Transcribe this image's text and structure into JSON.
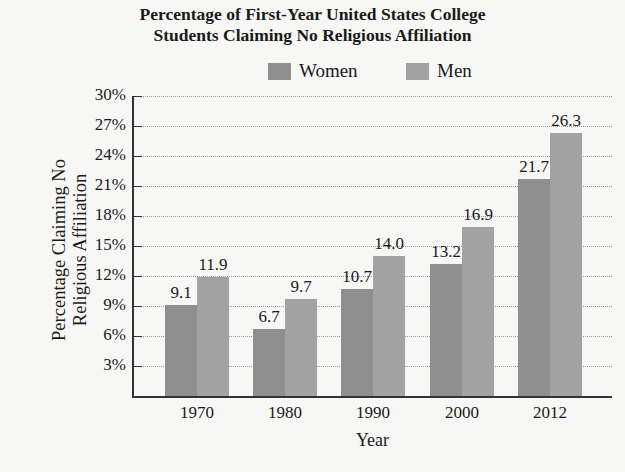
{
  "chart_data": {
    "type": "bar",
    "title_lines": [
      "Percentage of First-Year United States College",
      "Students Claiming No Religious Affiliation"
    ],
    "xlabel": "Year",
    "ylabel": "Percentage Claiming No Religious Affiliation",
    "ylabel_lines": [
      "Percentage Claiming No",
      "Religious Affiliation"
    ],
    "categories": [
      "1970",
      "1980",
      "1990",
      "2000",
      "2012"
    ],
    "series": [
      {
        "name": "Women",
        "color": "#8f8f8f",
        "values": [
          9.1,
          6.7,
          10.7,
          13.2,
          21.7
        ],
        "labels": [
          "9.1",
          "6.7",
          "10.7",
          "13.2",
          "21.7"
        ]
      },
      {
        "name": "Men",
        "color": "#a2a2a2",
        "values": [
          11.9,
          9.7,
          14.0,
          16.9,
          26.3
        ],
        "labels": [
          "11.9",
          "9.7",
          "14.0",
          "16.9",
          "26.3"
        ]
      }
    ],
    "ylim": [
      0,
      30
    ],
    "yticks": [
      "3%",
      "6%",
      "9%",
      "12%",
      "15%",
      "18%",
      "21%",
      "24%",
      "27%",
      "30%"
    ],
    "grid": true,
    "legend_position": "top"
  }
}
